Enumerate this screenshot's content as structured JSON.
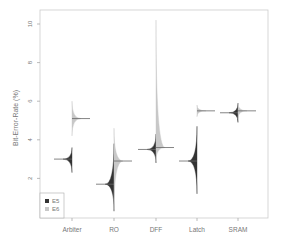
{
  "chart_data": {
    "type": "violin",
    "title": "",
    "xlabel": "",
    "ylabel": "Bit-Error-Rate (%)",
    "ylim": [
      0,
      10.5
    ],
    "yticks": [
      2,
      4,
      6,
      8,
      10
    ],
    "categories": [
      "Arbiter",
      "RO",
      "DFF",
      "Latch",
      "SRAM"
    ],
    "legend": {
      "position": "bottom-left",
      "entries": [
        "E5",
        "E6"
      ]
    },
    "colors": {
      "E5": "#333333",
      "E6": "#c8c8c8"
    },
    "series": [
      {
        "name": "E5",
        "side": "left",
        "medians": [
          3.0,
          1.7,
          3.5,
          2.9,
          5.4
        ],
        "spread_low": [
          2.3,
          0.3,
          2.8,
          1.2,
          4.9
        ],
        "spread_high": [
          3.6,
          3.8,
          4.3,
          4.7,
          5.9
        ]
      },
      {
        "name": "E6",
        "side": "right",
        "medians": [
          5.1,
          2.9,
          3.6,
          5.5,
          5.5
        ],
        "spread_low": [
          4.2,
          0.4,
          2.9,
          5.2,
          5.1
        ],
        "spread_high": [
          6.0,
          4.6,
          10.2,
          5.8,
          5.9
        ]
      }
    ]
  }
}
